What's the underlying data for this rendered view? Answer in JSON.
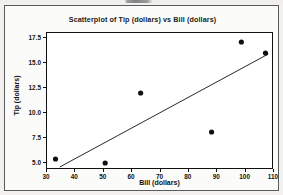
{
  "chart_data": {
    "type": "scatter",
    "title": "Scatterplot of Tip (dollars) vs Bill (dollars)",
    "xlabel": "Bill (dollars)",
    "ylabel": "Tip (dollars)",
    "xlim": [
      30,
      110
    ],
    "ylim": [
      4.3,
      18.0
    ],
    "xticks": [
      30,
      40,
      50,
      60,
      70,
      80,
      90,
      100,
      110
    ],
    "xtick_labels": [
      "30",
      "40",
      "50",
      "60",
      "70",
      "80",
      "90",
      "100",
      "110"
    ],
    "yticks": [
      5.0,
      7.5,
      10.0,
      12.5,
      15.0,
      17.5
    ],
    "ytick_labels": [
      "5.0",
      "7.5",
      "10.0",
      "12.5",
      "15.0",
      "17.5"
    ],
    "grid": false,
    "legend": null,
    "marker": "filled-circle",
    "marker_color": "#111111",
    "x": [
      33.0,
      50.5,
      63.0,
      88.0,
      98.5,
      107.0
    ],
    "y": [
      5.4,
      5.0,
      12.0,
      8.1,
      17.1,
      16.0
    ],
    "points": [
      {
        "x": 33.0,
        "y": 5.4
      },
      {
        "x": 50.5,
        "y": 5.0
      },
      {
        "x": 63.0,
        "y": 12.0
      },
      {
        "x": 88.0,
        "y": 8.1
      },
      {
        "x": 98.5,
        "y": 17.1
      },
      {
        "x": 107.0,
        "y": 16.0
      }
    ],
    "fit_line": {
      "type": "line",
      "color": "#111111",
      "x": [
        34.5,
        108.0
      ],
      "y": [
        4.6,
        15.9
      ]
    }
  },
  "figure": {
    "border_color": "#5a5a5a",
    "panel_color": "#ffffff",
    "background_color": "#f2f1ef"
  }
}
